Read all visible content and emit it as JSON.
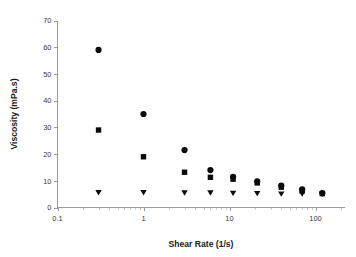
{
  "chart_data": {
    "type": "scatter",
    "title": "",
    "xlabel": "Shear Rate (1/s)",
    "ylabel": "Viscosity (mPa.s)",
    "xscale": "log",
    "yscale": "linear",
    "xlim": [
      0.1,
      200
    ],
    "ylim": [
      0,
      70
    ],
    "xticks": [
      0.1,
      1,
      10,
      100
    ],
    "xtick_labels": [
      "0.1",
      "1",
      "10",
      "100"
    ],
    "yticks": [
      0,
      10,
      20,
      30,
      40,
      50,
      60,
      70
    ],
    "ytick_labels": [
      "0",
      "10",
      "20",
      "30",
      "40",
      "50",
      "60",
      "70"
    ],
    "grid": false,
    "legend": "none",
    "x": [
      0.3,
      1.0,
      3.0,
      6.0,
      11.0,
      21.0,
      40.0,
      70.0,
      120.0
    ],
    "series": [
      {
        "name": "Series 1",
        "marker": "circle",
        "color": "#0b0b0b",
        "x": [
          0.3,
          1.0,
          3.0,
          6.0,
          11.0,
          21.0,
          40.0,
          70.0,
          120.0
        ],
        "values": [
          59.0,
          35.0,
          21.5,
          14.0,
          11.5,
          9.8,
          8.2,
          6.8,
          5.4
        ]
      },
      {
        "name": "Series 2",
        "marker": "square",
        "color": "#0b0b0b",
        "x": [
          0.3,
          1.0,
          3.0,
          6.0,
          11.0,
          21.0,
          40.0,
          70.0,
          120.0
        ],
        "values": [
          29.0,
          19.0,
          13.2,
          11.3,
          10.6,
          9.2,
          7.6,
          6.2,
          5.2
        ]
      },
      {
        "name": "Series 3",
        "marker": "triangle-down",
        "color": "#0b0b0b",
        "x": [
          0.3,
          1.0,
          3.0,
          6.0,
          11.0,
          21.0,
          40.0,
          70.0,
          120.0
        ],
        "values": [
          5.5,
          5.5,
          5.4,
          5.4,
          5.3,
          5.2,
          5.0,
          5.0,
          4.9
        ]
      }
    ]
  },
  "axes": {
    "x_title": "Shear Rate (1/s)",
    "y_title": "Viscosity (mPa.s)"
  }
}
